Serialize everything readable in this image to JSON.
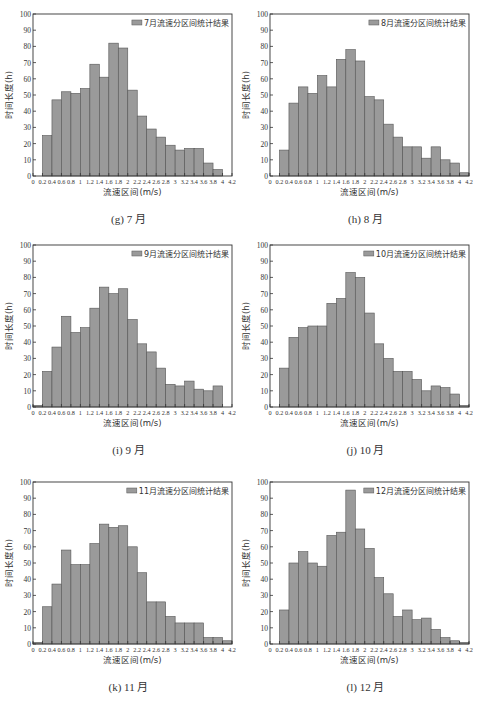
{
  "chart_data": [
    {
      "id": "g",
      "type": "bar",
      "caption": "(g) 7 月",
      "legend": "7月流速分区间统计结果",
      "xlabel": "流速区间(m/s)",
      "ylabel": "时间长度(h)",
      "ylim": [
        0,
        100
      ],
      "yticks": [
        "0",
        "10",
        "20",
        "30",
        "40",
        "50",
        "60",
        "70",
        "80",
        "90",
        "100"
      ],
      "xlim": [
        0,
        4.2
      ],
      "xticks": [
        "0",
        "0.2",
        "0.4",
        "0.6",
        "0.8",
        "1",
        "1.2",
        "1.4",
        "1.6",
        "1.8",
        "2",
        "2.2",
        "2.4",
        "2.6",
        "2.8",
        "3",
        "3.2",
        "3.4",
        "3.6",
        "3.8",
        "4",
        "4.2"
      ],
      "bin_width": 0.2,
      "bin_starts": [
        0.2,
        0.4,
        0.6,
        0.8,
        1.0,
        1.2,
        1.4,
        1.6,
        1.8,
        2.0,
        2.2,
        2.4,
        2.6,
        2.8,
        3.0,
        3.2,
        3.4,
        3.6,
        3.8
      ],
      "values": [
        25,
        47,
        52,
        51,
        54,
        69,
        61,
        82,
        79,
        53,
        37,
        29,
        24,
        19,
        16,
        17,
        17,
        8,
        4
      ]
    },
    {
      "id": "h",
      "type": "bar",
      "caption": "(h) 8 月",
      "legend": "8月流速分区间统计结果",
      "xlabel": "流速区间(m/s)",
      "ylabel": "时间长度(h)",
      "ylim": [
        0,
        100
      ],
      "yticks": [
        "0",
        "10",
        "20",
        "30",
        "40",
        "50",
        "60",
        "70",
        "80",
        "90",
        "100"
      ],
      "xlim": [
        0,
        4.2
      ],
      "xticks": [
        "0",
        "0.2",
        "0.4",
        "0.6",
        "0.8",
        "1",
        "1.2",
        "1.4",
        "1.6",
        "1.8",
        "2",
        "2.2",
        "2.4",
        "2.6",
        "2.8",
        "3",
        "3.2",
        "3.4",
        "3.6",
        "3.8",
        "4",
        "4.2"
      ],
      "bin_width": 0.2,
      "bin_starts": [
        0.2,
        0.4,
        0.6,
        0.8,
        1.0,
        1.2,
        1.4,
        1.6,
        1.8,
        2.0,
        2.2,
        2.4,
        2.6,
        2.8,
        3.0,
        3.2,
        3.4,
        3.6,
        3.8,
        4.0
      ],
      "values": [
        16,
        45,
        55,
        51,
        62,
        55,
        72,
        78,
        71,
        49,
        47,
        32,
        24,
        18,
        18,
        11,
        18,
        10,
        8,
        2
      ]
    },
    {
      "id": "i",
      "type": "bar",
      "caption": "(i) 9 月",
      "legend": "9月流速分区间统计结果",
      "xlabel": "流速区间(m/s)",
      "ylabel": "时间长度(h)",
      "ylim": [
        0,
        100
      ],
      "yticks": [
        "0",
        "10",
        "20",
        "30",
        "40",
        "50",
        "60",
        "70",
        "80",
        "90",
        "100"
      ],
      "xlim": [
        0,
        4.2
      ],
      "xticks": [
        "0",
        "0.2",
        "0.4",
        "0.6",
        "0.8",
        "1",
        "1.2",
        "1.4",
        "1.6",
        "1.8",
        "2",
        "2.2",
        "2.4",
        "2.6",
        "2.8",
        "3",
        "3.2",
        "3.4",
        "3.6",
        "3.8",
        "4",
        "4.2"
      ],
      "bin_width": 0.2,
      "bin_starts": [
        0.0,
        0.2,
        0.4,
        0.6,
        0.8,
        1.0,
        1.2,
        1.4,
        1.6,
        1.8,
        2.0,
        2.2,
        2.4,
        2.6,
        2.8,
        3.0,
        3.2,
        3.4,
        3.6,
        3.8
      ],
      "values": [
        1,
        22,
        37,
        56,
        46,
        49,
        61,
        74,
        70,
        73,
        54,
        39,
        34,
        24,
        14,
        13,
        16,
        11,
        10,
        13
      ]
    },
    {
      "id": "j",
      "type": "bar",
      "caption": "(j) 10 月",
      "legend": "10月流速分区间统计结果",
      "xlabel": "流速区间(m/s)",
      "ylabel": "时间长度(h)",
      "ylim": [
        0,
        100
      ],
      "yticks": [
        "0",
        "10",
        "20",
        "30",
        "40",
        "50",
        "60",
        "70",
        "80",
        "90",
        "100"
      ],
      "xlim": [
        0,
        4.2
      ],
      "xticks": [
        "0",
        "0.2",
        "0.4",
        "0.6",
        "0.8",
        "1",
        "1.2",
        "1.4",
        "1.6",
        "1.8",
        "2",
        "2.2",
        "2.4",
        "2.6",
        "2.8",
        "3",
        "3.2",
        "3.4",
        "3.6",
        "3.8",
        "4",
        "4.2"
      ],
      "bin_width": 0.2,
      "bin_starts": [
        0.2,
        0.4,
        0.6,
        0.8,
        1.0,
        1.2,
        1.4,
        1.6,
        1.8,
        2.0,
        2.2,
        2.4,
        2.6,
        2.8,
        3.0,
        3.2,
        3.4,
        3.6,
        3.8,
        4.0
      ],
      "values": [
        24,
        43,
        49,
        50,
        50,
        64,
        67,
        83,
        80,
        58,
        39,
        30,
        22,
        22,
        17,
        10,
        13,
        12,
        8,
        1
      ]
    },
    {
      "id": "k",
      "type": "bar",
      "caption": "(k) 11 月",
      "legend": "11月流速分区间统计结果",
      "xlabel": "流速区间(m/s)",
      "ylabel": "时间长度(h)",
      "ylim": [
        0,
        100
      ],
      "yticks": [
        "0",
        "10",
        "20",
        "30",
        "40",
        "50",
        "60",
        "70",
        "80",
        "90",
        "100"
      ],
      "xlim": [
        0,
        4.2
      ],
      "xticks": [
        "0",
        "0.2",
        "0.4",
        "0.6",
        "0.8",
        "1",
        "1.2",
        "1.4",
        "1.6",
        "1.8",
        "2",
        "2.2",
        "2.4",
        "2.6",
        "2.8",
        "3",
        "3.2",
        "3.4",
        "3.6",
        "3.8",
        "4",
        "4.2"
      ],
      "bin_width": 0.2,
      "bin_starts": [
        0.0,
        0.2,
        0.4,
        0.6,
        0.8,
        1.0,
        1.2,
        1.4,
        1.6,
        1.8,
        2.0,
        2.2,
        2.4,
        2.6,
        2.8,
        3.0,
        3.2,
        3.4,
        3.6,
        3.8,
        4.0
      ],
      "values": [
        1,
        23,
        37,
        58,
        49,
        49,
        62,
        74,
        72,
        73,
        60,
        44,
        26,
        26,
        17,
        13,
        13,
        13,
        4,
        4,
        2
      ]
    },
    {
      "id": "l",
      "type": "bar",
      "caption": "(l) 12 月",
      "legend": "12月流速分区间统计结果",
      "xlabel": "流速区间(m/s)",
      "ylabel": "时间长度(h)",
      "ylim": [
        0,
        100
      ],
      "yticks": [
        "0",
        "10",
        "20",
        "30",
        "40",
        "50",
        "60",
        "70",
        "80",
        "90",
        "100"
      ],
      "xlim": [
        0,
        4.2
      ],
      "xticks": [
        "0",
        "0.2",
        "0.4",
        "0.6",
        "0.8",
        "1",
        "1.2",
        "1.4",
        "1.6",
        "1.8",
        "2",
        "2.2",
        "2.4",
        "2.6",
        "2.8",
        "3",
        "3.2",
        "3.4",
        "3.6",
        "3.8",
        "4",
        "4.2"
      ],
      "bin_width": 0.2,
      "bin_starts": [
        0.2,
        0.4,
        0.6,
        0.8,
        1.0,
        1.2,
        1.4,
        1.6,
        1.8,
        2.0,
        2.2,
        2.4,
        2.6,
        2.8,
        3.0,
        3.2,
        3.4,
        3.6,
        3.8,
        4.0
      ],
      "values": [
        21,
        50,
        57,
        50,
        48,
        67,
        69,
        95,
        71,
        59,
        41,
        31,
        17,
        21,
        15,
        16,
        9,
        4,
        2,
        1
      ]
    }
  ],
  "colors": {
    "bar_fill": "#9a9a9a",
    "bar_stroke": "#555555",
    "axis": "#333333",
    "text": "#333333"
  }
}
